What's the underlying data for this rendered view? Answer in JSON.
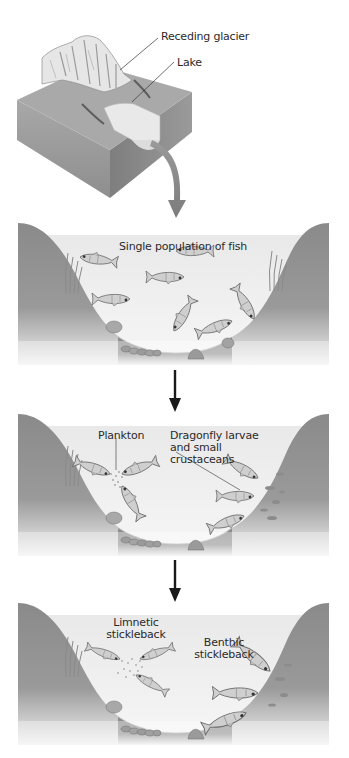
{
  "colors": {
    "background": "#ffffff",
    "terrain": "#8c8c8c",
    "terrain_dark": "#7a7a7a",
    "water": "#ececec",
    "water_light": "#f4f4f4",
    "fish": "#c9c9c9",
    "text": "#2a2a2a",
    "arrow": "#1a1a1a",
    "curved_arrow": "#8a8a8a"
  },
  "block_diagram": {
    "labels": {
      "glacier": "Receding glacier",
      "lake": "Lake"
    }
  },
  "panels": [
    {
      "id": "panel-1",
      "labels": {
        "population": "Single population of fish"
      }
    },
    {
      "id": "panel-2",
      "labels": {
        "plankton": "Plankton",
        "benthic_food_line1": "Dragonfly larvae",
        "benthic_food_line2": "and small",
        "benthic_food_line3": "crustaceans"
      }
    },
    {
      "id": "panel-3",
      "labels": {
        "limnetic_line1": "Limnetic",
        "limnetic_line2": "stickleback",
        "benthic_line1": "Benthic",
        "benthic_line2": "stickleback"
      }
    }
  ],
  "arrows": [
    {
      "from": "block_diagram",
      "to": "panel-1",
      "style": "curved-gray"
    },
    {
      "from": "panel-1",
      "to": "panel-2",
      "style": "straight-black"
    },
    {
      "from": "panel-2",
      "to": "panel-3",
      "style": "straight-black"
    }
  ],
  "icons": {
    "fish": "fish-icon",
    "rock": "rock-icon",
    "plant": "aquatic-plant-icon",
    "plankton": "plankton-dots-icon"
  }
}
